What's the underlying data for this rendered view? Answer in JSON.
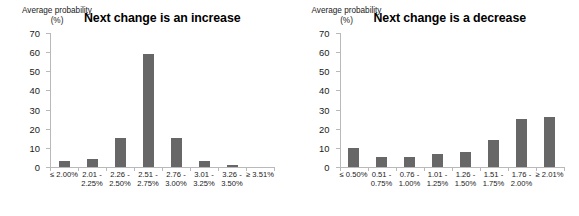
{
  "figure": {
    "panels": [
      {
        "id": "increase",
        "title": "Next change is an increase",
        "axis_label": "Average\nprobability\n(%)"
      },
      {
        "id": "decrease",
        "title": "Next change is a decrease",
        "axis_label": "Average\nprobability\n(%)"
      }
    ]
  },
  "chart_data": [
    {
      "type": "bar",
      "title": "Next change is an increase",
      "xlabel": "",
      "ylabel": "Average probability (%)",
      "ylim": [
        0,
        70
      ],
      "yticks": [
        0,
        10,
        20,
        30,
        40,
        50,
        60,
        70
      ],
      "grid": false,
      "legend": false,
      "bar_color": "#676767",
      "categories": [
        "≤ 2.00%",
        "2.01 -\n2.25%",
        "2.26 -\n2.50%",
        "2.51 -\n2.75%",
        "2.76 -\n3.00%",
        "3.01 -\n3.25%",
        "3.26 -\n3.50%",
        "≥ 3.51%"
      ],
      "values": [
        3,
        4,
        15,
        59,
        15,
        3,
        1,
        0
      ]
    },
    {
      "type": "bar",
      "title": "Next change is a decrease",
      "xlabel": "",
      "ylabel": "Average probability (%)",
      "ylim": [
        0,
        70
      ],
      "yticks": [
        0,
        10,
        20,
        30,
        40,
        50,
        60,
        70
      ],
      "grid": false,
      "legend": false,
      "bar_color": "#676767",
      "categories": [
        "≤ 0.50%",
        "0.51 -\n0.75%",
        "0.76 -\n1.00%",
        "1.01 -\n1.25%",
        "1.26 -\n1.50%",
        "1.51 -\n1.75%",
        "1.76 -\n2.00%",
        "≥ 2.01%"
      ],
      "values": [
        10,
        5,
        5,
        7,
        8,
        14,
        25,
        26
      ]
    }
  ]
}
